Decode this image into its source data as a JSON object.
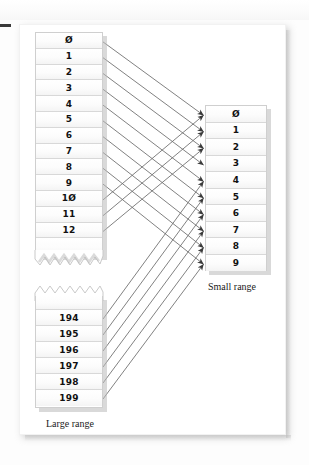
{
  "figure": {
    "background_color": "#ffffff",
    "panel_color": "#ffffff",
    "line_color": "#5d5d5d",
    "cell_border_color": "#d8d8d8",
    "shadow_color": "#b9b9b9"
  },
  "margin_mark": {
    "name": "page-margin-dash",
    "color": "#3b3b3b"
  },
  "large_range": {
    "caption": "Large range",
    "top_cells": [
      "0",
      "1",
      "2",
      "3",
      "4",
      "5",
      "6",
      "7",
      "8",
      "9",
      "10",
      "11",
      "12"
    ],
    "bottom_cells": [
      "194",
      "195",
      "196",
      "197",
      "198",
      "199"
    ],
    "torn_edge_top_section": "zigzag-bottom",
    "torn_edge_bottom_section": "zigzag-top"
  },
  "small_range": {
    "caption": "Small range",
    "cells": [
      "0",
      "1",
      "2",
      "3",
      "4",
      "5",
      "6",
      "7",
      "8",
      "9"
    ]
  },
  "mappings": {
    "description": "Each large-range index maps by modulo onto a small-range index",
    "from_top": [
      {
        "source": "0",
        "target": "0"
      },
      {
        "source": "1",
        "target": "1"
      },
      {
        "source": "2",
        "target": "2"
      },
      {
        "source": "3",
        "target": "3"
      },
      {
        "source": "4",
        "target": "4"
      },
      {
        "source": "5",
        "target": "5"
      },
      {
        "source": "6",
        "target": "6"
      },
      {
        "source": "7",
        "target": "7"
      },
      {
        "source": "8",
        "target": "8"
      },
      {
        "source": "9",
        "target": "9"
      },
      {
        "source": "10",
        "target": "0"
      },
      {
        "source": "11",
        "target": "1"
      },
      {
        "source": "12",
        "target": "2"
      }
    ],
    "from_bottom": [
      {
        "source": "194",
        "target": "4"
      },
      {
        "source": "195",
        "target": "5"
      },
      {
        "source": "196",
        "target": "6"
      },
      {
        "source": "197",
        "target": "7"
      },
      {
        "source": "198",
        "target": "8"
      },
      {
        "source": "199",
        "target": "9"
      }
    ]
  }
}
